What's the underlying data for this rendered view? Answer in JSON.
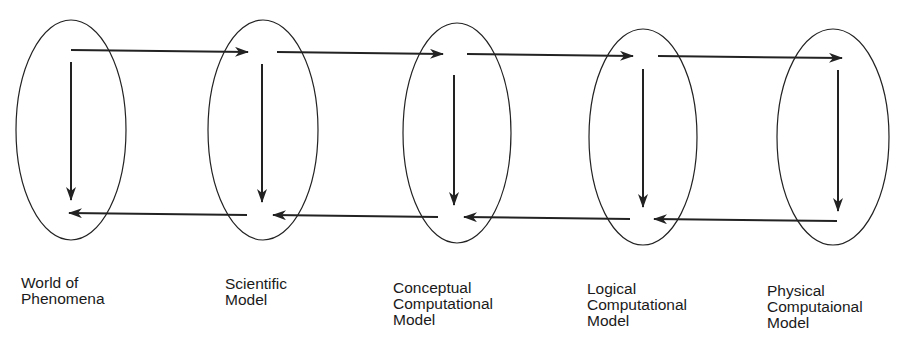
{
  "diagram": {
    "stroke_color": "#222222",
    "nodes": [
      {
        "id": "world",
        "lines": [
          "World of",
          "Phenomena"
        ],
        "ellipse": {
          "cx": 71,
          "cy": 130,
          "rx": 55,
          "ry": 110
        },
        "label_pos": {
          "x": 21,
          "y": 275
        }
      },
      {
        "id": "scientific",
        "lines": [
          "Scientific",
          "Model"
        ],
        "ellipse": {
          "cx": 263,
          "cy": 130,
          "rx": 55,
          "ry": 110
        },
        "label_pos": {
          "x": 225,
          "y": 276
        }
      },
      {
        "id": "conceptual",
        "lines": [
          "Conceptual",
          "Computational",
          "Model"
        ],
        "ellipse": {
          "cx": 457,
          "cy": 133,
          "rx": 54,
          "ry": 110
        },
        "label_pos": {
          "x": 393,
          "y": 280
        }
      },
      {
        "id": "logical",
        "lines": [
          "Logical",
          "Computational",
          "Model"
        ],
        "ellipse": {
          "cx": 643,
          "cy": 137,
          "rx": 54,
          "ry": 108
        },
        "label_pos": {
          "x": 587,
          "y": 281
        }
      },
      {
        "id": "physical",
        "lines": [
          "Physical",
          "Computaional",
          "Model"
        ],
        "ellipse": {
          "cx": 833,
          "cy": 137,
          "rx": 56,
          "ry": 108
        },
        "label_pos": {
          "x": 767,
          "y": 283
        }
      }
    ],
    "edges": [
      {
        "from": "world",
        "to": "scientific",
        "direction": "forward",
        "x1": 71,
        "y1": 50,
        "x2": 248,
        "y2": 52
      },
      {
        "from": "scientific",
        "to": "conceptual",
        "direction": "forward",
        "x1": 277,
        "y1": 52,
        "x2": 443,
        "y2": 54
      },
      {
        "from": "conceptual",
        "to": "logical",
        "direction": "forward",
        "x1": 467,
        "y1": 54,
        "x2": 633,
        "y2": 56
      },
      {
        "from": "logical",
        "to": "physical",
        "direction": "forward",
        "x1": 658,
        "y1": 56,
        "x2": 842,
        "y2": 58
      },
      {
        "from": "world",
        "to": "world",
        "direction": "down",
        "x1": 71,
        "y1": 62,
        "x2": 71,
        "y2": 200
      },
      {
        "from": "scientific",
        "to": "scientific",
        "direction": "down",
        "x1": 262,
        "y1": 64,
        "x2": 262,
        "y2": 202
      },
      {
        "from": "conceptual",
        "to": "conceptual",
        "direction": "down",
        "x1": 454,
        "y1": 75,
        "x2": 454,
        "y2": 205
      },
      {
        "from": "logical",
        "to": "logical",
        "direction": "down",
        "x1": 643,
        "y1": 69,
        "x2": 643,
        "y2": 207
      },
      {
        "from": "physical",
        "to": "physical",
        "direction": "down",
        "x1": 838,
        "y1": 70,
        "x2": 838,
        "y2": 211
      },
      {
        "from": "scientific",
        "to": "world",
        "direction": "backward",
        "x1": 247,
        "y1": 215,
        "x2": 69,
        "y2": 213
      },
      {
        "from": "conceptual",
        "to": "scientific",
        "direction": "backward",
        "x1": 438,
        "y1": 217,
        "x2": 273,
        "y2": 215
      },
      {
        "from": "logical",
        "to": "conceptual",
        "direction": "backward",
        "x1": 630,
        "y1": 219,
        "x2": 464,
        "y2": 217
      },
      {
        "from": "physical",
        "to": "logical",
        "direction": "backward",
        "x1": 837,
        "y1": 221,
        "x2": 654,
        "y2": 219
      }
    ]
  }
}
